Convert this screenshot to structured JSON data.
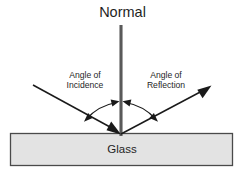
{
  "diagram": {
    "type": "optics-ray-diagram",
    "background_color": "#ffffff",
    "labels": {
      "normal": "Normal",
      "angle_of_incidence_line1": "Angle of",
      "angle_of_incidence_line2": "Incidence",
      "angle_of_reflection_line1": "Angle of",
      "angle_of_reflection_line2": "Reflection",
      "glass": "Glass"
    },
    "colors": {
      "ray_stroke": "#1a1a1a",
      "normal_stroke": "#5a5a5a",
      "arc_stroke": "#1a1a1a",
      "glass_fill": "#e3e3e3",
      "glass_border": "#4a4a4a",
      "text": "#262626"
    },
    "geometry": {
      "incident_point_x": 121,
      "incident_point_y": 134,
      "normal_top_y": 25,
      "normal_bottom_y": 136,
      "incident_ray_start_x": 33,
      "incident_ray_start_y": 85,
      "reflected_ray_end_x": 211,
      "reflected_ray_end_y": 85,
      "glass_left": 10,
      "glass_top": 133,
      "glass_right": 233,
      "glass_bottom": 166
    }
  }
}
